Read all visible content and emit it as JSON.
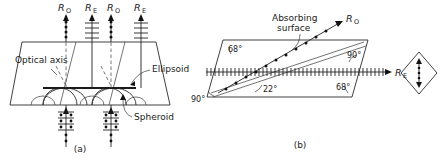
{
  "figure": {
    "panels": [
      {
        "id": "a",
        "caption": "(a)",
        "description": "Huygens wavelet construction for double refraction in a uniaxial crystal",
        "labels": {
          "optical_axis": "Optical axis",
          "ellipsoid": "Ellipsoid",
          "spheroid": "Spheroid"
        },
        "ray_labels": [
          {
            "symbol": "R",
            "sub": "O",
            "x": 62
          },
          {
            "symbol": "R",
            "sub": "E",
            "x": 89
          },
          {
            "symbol": "R",
            "sub": "O",
            "x": 111
          },
          {
            "symbol": "R",
            "sub": "E",
            "x": 138
          }
        ]
      },
      {
        "id": "b",
        "caption": "(b)",
        "description": "Polarizing prism with absorbing surface",
        "labels": {
          "absorbing_surface_line1": "Absorbing",
          "absorbing_surface_line2": "surface"
        },
        "ray_labels": [
          {
            "symbol": "R",
            "sub": "O"
          },
          {
            "symbol": "R",
            "sub": "E"
          }
        ],
        "angles": [
          {
            "value": "68°",
            "x": 233,
            "y": 47
          },
          {
            "value": "90°",
            "x": 352,
            "y": 55
          },
          {
            "value": "90°",
            "x": 196,
            "y": 100
          },
          {
            "value": "22°",
            "x": 269,
            "y": 91
          },
          {
            "value": "68°",
            "x": 340,
            "y": 89
          }
        ]
      }
    ],
    "colors": {
      "ink": "#1a1a1a",
      "line": "#2a2a2a",
      "dashed": "#555555",
      "background": "#ffffff"
    }
  }
}
